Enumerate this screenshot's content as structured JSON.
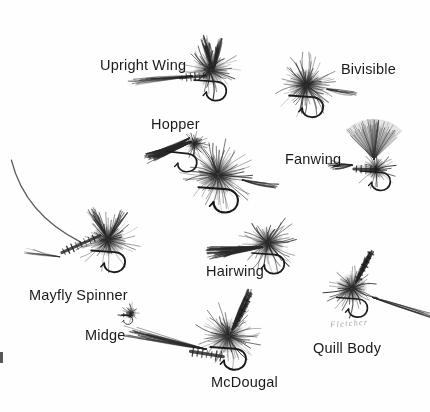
{
  "plate": {
    "title": "Dry Fly Patterns",
    "medium": "pen-and-ink illustration",
    "background_color": "#fefefe",
    "ink_color": "#2b2b2b",
    "width": 430,
    "height": 412,
    "signature": "Fletcher"
  },
  "labels": [
    {
      "id": "upright-wing",
      "text": "Upright Wing",
      "x": 100,
      "y": 58
    },
    {
      "id": "bivisible",
      "text": "Bivisible",
      "x": 341,
      "y": 62
    },
    {
      "id": "hopper",
      "text": "Hopper",
      "x": 151,
      "y": 117
    },
    {
      "id": "fanwing",
      "text": "Fanwing",
      "x": 285,
      "y": 152
    },
    {
      "id": "hairwing",
      "text": "Hairwing",
      "x": 206,
      "y": 264
    },
    {
      "id": "mayfly-spinner",
      "text": "Mayfly Spinner",
      "x": 29,
      "y": 288
    },
    {
      "id": "midge",
      "text": "Midge",
      "x": 85,
      "y": 328
    },
    {
      "id": "quill-body",
      "text": "Quill Body",
      "x": 313,
      "y": 341
    },
    {
      "id": "mcdougal",
      "text": "McDougal",
      "x": 211,
      "y": 375
    }
  ],
  "flies": [
    {
      "id": "upright-wing",
      "name": "Upright Wing dry fly",
      "cx": 210,
      "cy": 70,
      "scale": 1.0,
      "rotation": 0,
      "hackle_density": 64,
      "wing": "upright-split",
      "tail": "long-left"
    },
    {
      "id": "bivisible",
      "name": "Bivisible dry fly",
      "cx": 306,
      "cy": 85,
      "scale": 1.05,
      "rotation": 0,
      "hackle_density": 96,
      "wing": "none",
      "tail": "short-right"
    },
    {
      "id": "hopper",
      "name": "Hopper dry fly",
      "cx": 176,
      "cy": 140,
      "scale": 0.95,
      "rotation": -22,
      "hackle_density": 40,
      "wing": "down-wing",
      "tail": "none"
    },
    {
      "id": "fanwing",
      "name": "Fanwing dry fly",
      "cx": 380,
      "cy": 163,
      "scale": 1.0,
      "rotation": 0,
      "hackle_density": 34,
      "wing": "fan",
      "tail": "feather-left"
    },
    {
      "id": "big-center",
      "name": "Large palmer dry fly",
      "cx": 218,
      "cy": 175,
      "scale": 1.22,
      "rotation": 0,
      "hackle_density": 84,
      "wing": "none",
      "tail": "short-right"
    },
    {
      "id": "mayfly-spinner",
      "name": "Mayfly Spinner",
      "cx": 108,
      "cy": 240,
      "scale": 1.05,
      "rotation": 0,
      "hackle_density": 72,
      "wing": "spent",
      "tail": "long-curved"
    },
    {
      "id": "hairwing",
      "name": "Hairwing dry fly",
      "cx": 268,
      "cy": 243,
      "scale": 1.0,
      "rotation": 0,
      "hackle_density": 66,
      "wing": "hair-left",
      "tail": "none"
    },
    {
      "id": "midge",
      "name": "Midge dry fly",
      "cx": 131,
      "cy": 313,
      "scale": 0.34,
      "rotation": 0,
      "hackle_density": 22,
      "wing": "tiny",
      "tail": "none"
    },
    {
      "id": "mcdougal",
      "name": "McDougal dry fly",
      "cx": 228,
      "cy": 336,
      "scale": 1.1,
      "rotation": 0,
      "hackle_density": 76,
      "wing": "quill-up",
      "tail": "fibre-left"
    },
    {
      "id": "quill-body",
      "name": "Quill Body dry fly",
      "cx": 352,
      "cy": 288,
      "scale": 0.95,
      "rotation": 0,
      "hackle_density": 58,
      "wing": "quill-up",
      "tail": "long-right"
    }
  ],
  "marks": {
    "left_edge_tick": true
  }
}
